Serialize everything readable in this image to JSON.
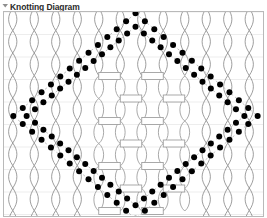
{
  "header": {
    "title": "Knotting Diagram",
    "collapse_icon": "triangle-down-icon",
    "title_color": "#2a2a2a"
  },
  "diagram": {
    "name": "knotting-diagram-canvas",
    "background": "#ffffff",
    "border_color": "#b9b9b9",
    "thread_color": "#8c8c8c",
    "knot_color": "#9a9a9a",
    "grid_color": "#ededed",
    "dot_color": "#000000",
    "dot_radius": 3.0,
    "dash_color": "#bdbdbd",
    "width": 261,
    "height": 206,
    "columns": 12,
    "rows": 9,
    "col_spacing": 21.5,
    "row_spacing": 22.5,
    "lens_half_width": 5.5,
    "bar_width": 22,
    "bar_height": 7,
    "knot_region": {
      "x0": 84,
      "y0": 64,
      "x1": 178,
      "y1": 200
    },
    "diamond": {
      "shape": "diamond-dotted-outline",
      "top": [
        131,
        8
      ],
      "right": [
        247,
        100
      ],
      "bottom": [
        131,
        200
      ],
      "left": [
        16,
        100
      ],
      "offset": 7,
      "dots_per_edge": 13
    }
  }
}
